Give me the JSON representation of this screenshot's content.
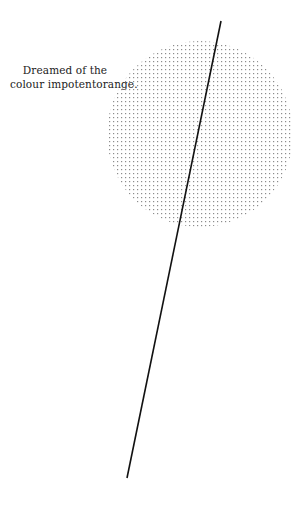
{
  "caption": {
    "line1": "Dreamed of the",
    "line2": "colour impotentorange."
  },
  "figure": {
    "circle": {
      "cx": 200,
      "cy": 134,
      "r": 93,
      "dot_spacing": 4,
      "dot_color": "#9a9a9a"
    },
    "line": {
      "x1": 221,
      "y1": 21,
      "x2": 127,
      "y2": 478,
      "color": "#111111",
      "width": 1.6
    }
  }
}
